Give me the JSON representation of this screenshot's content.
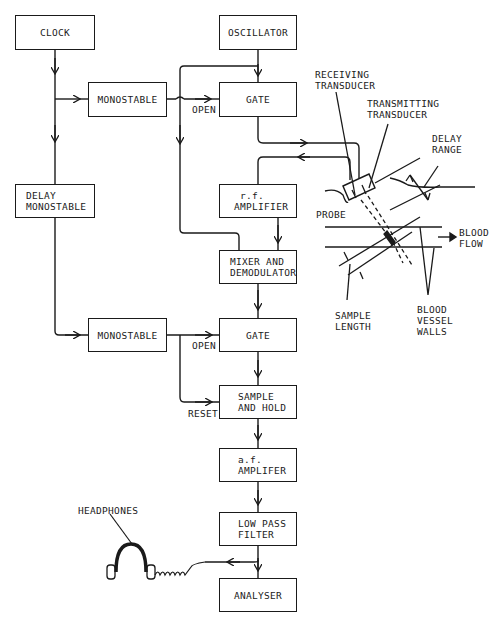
{
  "diagram": {
    "type": "block-diagram",
    "title": "",
    "blocks": {
      "clock": [
        "CLOCK"
      ],
      "monostable_1": [
        "MONOSTABLE"
      ],
      "delay_monostable": [
        "DELAY",
        "MONOSTABLE"
      ],
      "monostable_2": [
        "MONOSTABLE"
      ],
      "oscillator": [
        "OSCILLATOR"
      ],
      "gate_1": [
        "GATE"
      ],
      "rf_amplifier": [
        "r.f.",
        "AMPLIFIER"
      ],
      "mixer_demodulator": [
        "MIXER AND",
        "DEMODULATOR"
      ],
      "gate_2": [
        "GATE"
      ],
      "sample_hold": [
        "SAMPLE",
        "AND HOLD"
      ],
      "af_amplifier": [
        "a.f.",
        "AMPLIFER"
      ],
      "low_pass_filter": [
        "LOW PASS",
        "FILTER"
      ],
      "analyser": [
        "ANALYSER"
      ]
    },
    "labels": {
      "open_1": "OPEN",
      "open_2": "OPEN",
      "reset": "RESET",
      "receiving_transducer": [
        "RECEIVING",
        "TRANSDUCER"
      ],
      "transmitting_transducer": [
        "TRANSMITTING",
        "TRANSDUCER"
      ],
      "delay_range": [
        "DELAY",
        "RANGE"
      ],
      "probe": "PROBE",
      "blood_flow": [
        "BLOOD",
        "FLOW"
      ],
      "sample_length": [
        "SAMPLE",
        "LENGTH"
      ],
      "blood_vessel_walls": [
        "BLOOD",
        "VESSEL",
        "WALLS"
      ],
      "headphones": "HEADPHONES"
    },
    "connections": [
      {
        "from": "clock",
        "to": "monostable_1"
      },
      {
        "from": "clock",
        "to": "delay_monostable"
      },
      {
        "from": "monostable_1",
        "to": "gate_1",
        "label": "OPEN"
      },
      {
        "from": "oscillator",
        "to": "gate_1"
      },
      {
        "from": "oscillator",
        "to": "mixer_demodulator"
      },
      {
        "from": "gate_1",
        "to": "transmitting_transducer"
      },
      {
        "from": "receiving_transducer",
        "to": "rf_amplifier"
      },
      {
        "from": "rf_amplifier",
        "to": "mixer_demodulator"
      },
      {
        "from": "mixer_demodulator",
        "to": "gate_2"
      },
      {
        "from": "delay_monostable",
        "to": "monostable_2"
      },
      {
        "from": "monostable_2",
        "to": "gate_2",
        "label": "OPEN"
      },
      {
        "from": "monostable_2",
        "to": "sample_hold",
        "label": "RESET"
      },
      {
        "from": "gate_2",
        "to": "sample_hold"
      },
      {
        "from": "sample_hold",
        "to": "af_amplifier"
      },
      {
        "from": "af_amplifier",
        "to": "low_pass_filter"
      },
      {
        "from": "low_pass_filter",
        "to": "analyser"
      },
      {
        "from": "low_pass_filter",
        "to": "headphones"
      }
    ]
  }
}
